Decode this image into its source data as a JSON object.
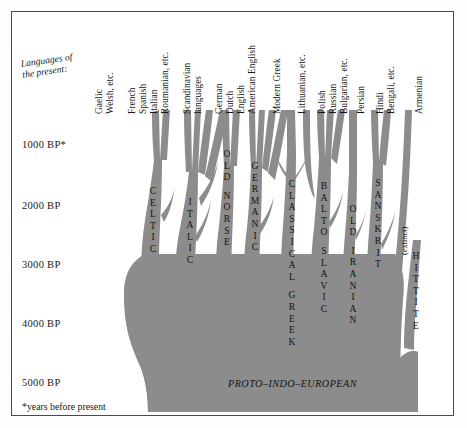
{
  "figure": {
    "title_present": "Languages of\nthe present:",
    "footnote": "*years before present",
    "trunk_label": "PROTO–INDO–EUROPEAN",
    "extinct_marker": "(extinct)",
    "tree_color": "#8c8c8c",
    "frame_color": "#4a4a4a",
    "background": "#ffffff"
  },
  "chart_data": {
    "type": "diagram",
    "ylabel": "years before present",
    "axis_ticks": [
      {
        "label": "1000 BP*",
        "value": 1000,
        "y": 145
      },
      {
        "label": "2000 BP",
        "value": 2000,
        "y": 206
      },
      {
        "label": "3000 BP",
        "value": 3000,
        "y": 265
      },
      {
        "label": "4000 BP",
        "value": 4000,
        "y": 324
      },
      {
        "label": "5000 BP",
        "value": 5000,
        "y": 383
      }
    ],
    "root": "PROTO-INDO-EUROPEAN",
    "branches": [
      {
        "name": "CELTIC",
        "tips": [
          "Gaelic",
          "Welsh, etc."
        ]
      },
      {
        "name": "ITALIC",
        "tips": [
          "French",
          "Spanish",
          "Italian",
          "Roumanian, etc."
        ]
      },
      {
        "name": "OLD NORSE",
        "tips": [
          "Scandinavian",
          "languages"
        ]
      },
      {
        "name": "GERMANIC",
        "tips": [
          "German",
          "Dutch",
          "English",
          "American English"
        ]
      },
      {
        "name": "CLASSICAL GREEK",
        "tips": [
          "Modern Greek"
        ]
      },
      {
        "name": "BALTO SLAVIC",
        "tips": [
          "Lithuanian, etc.",
          "Polish",
          "Russian",
          "Bulgarian, etc."
        ]
      },
      {
        "name": "OLD IRANIAN",
        "tips": [
          "Persian"
        ]
      },
      {
        "name": "SANSKRIT",
        "tips": [
          "Hindi",
          "Bengali, etc."
        ]
      },
      {
        "name": "ARMENIAN",
        "tips": [
          "Armenian"
        ]
      },
      {
        "name": "HITTITE",
        "tips": [],
        "extinct": true
      }
    ]
  },
  "axis": {
    "t1000": "1000 BP*",
    "t2000": "2000 BP",
    "t3000": "3000 BP",
    "t4000": "4000 BP",
    "t5000": "5000 BP"
  },
  "tips": {
    "gaelic": "Gaelic",
    "welsh": "Welsh, etc.",
    "french": "French",
    "spanish": "Spanish",
    "italian": "Italian",
    "roumanian": "Roumanian, etc.",
    "scandinavian1": "Scandinavian",
    "scandinavian2": "languages",
    "german": "German",
    "dutch": "Dutch",
    "english": "English",
    "american_english": "American English",
    "modern_greek": "Modern Greek",
    "lithuanian": "Lithuanian, etc.",
    "polish": "Polish",
    "russian": "Russian",
    "bulgarian": "Bulgarian, etc.",
    "persian": "Persian",
    "hindi": "Hindi",
    "bengali": "Bengali, etc.",
    "armenian": "Armenian"
  },
  "branch_names": {
    "celtic": "CELTIC",
    "italic": "ITALIC",
    "old_norse": "OLD NORSE",
    "germanic": "GERMANIC",
    "classical_greek": "CLASSICAL GREEK",
    "balto_slavic": "BALTO SLAVIC",
    "old_iranian": "OLD IRANIAN",
    "sanskrit": "SANSKRIT",
    "hittite": "HITTITE"
  }
}
